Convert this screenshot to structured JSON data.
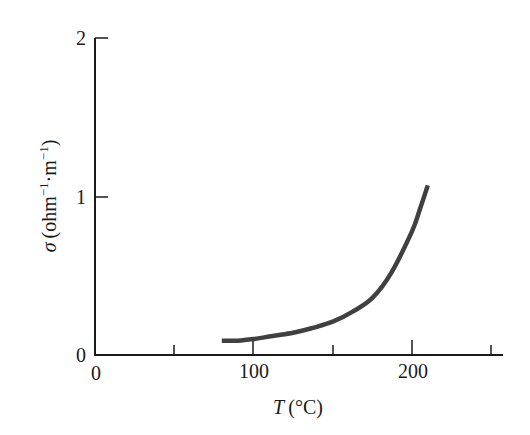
{
  "chart_data": {
    "type": "line",
    "title": "",
    "xlabel": "T (°C)",
    "ylabel": "σ (ohm⁻¹·m⁻¹)",
    "xlim": [
      0,
      255
    ],
    "ylim": [
      0,
      2
    ],
    "x_ticks": [
      0,
      50,
      100,
      150,
      200,
      250
    ],
    "x_tick_labels": [
      "0",
      "",
      "100",
      "",
      "200",
      ""
    ],
    "y_ticks": [
      0,
      1,
      2
    ],
    "y_tick_labels": [
      "0",
      "1",
      "2"
    ],
    "grid": false,
    "legend": null,
    "series": [
      {
        "name": "conductivity",
        "x": [
          80,
          90,
          100,
          112,
          125,
          137,
          150,
          162,
          175,
          187,
          200,
          205,
          210
        ],
        "y": [
          0.09,
          0.09,
          0.1,
          0.12,
          0.14,
          0.17,
          0.21,
          0.27,
          0.36,
          0.52,
          0.78,
          0.92,
          1.07
        ],
        "color": "#404040"
      }
    ]
  },
  "labels": {
    "x_axis": "(°C)",
    "x_axis_var": "T",
    "y_axis_var": "σ",
    "y_axis_unit_open": "(ohm",
    "y_axis_sup1": "−1",
    "y_axis_mid": "·m",
    "y_axis_sup2": "−1",
    "y_axis_close": ")",
    "x_tick_0": "0",
    "x_tick_100": "100",
    "x_tick_200": "200",
    "y_tick_0": "0",
    "y_tick_1": "1",
    "y_tick_2": "2"
  }
}
